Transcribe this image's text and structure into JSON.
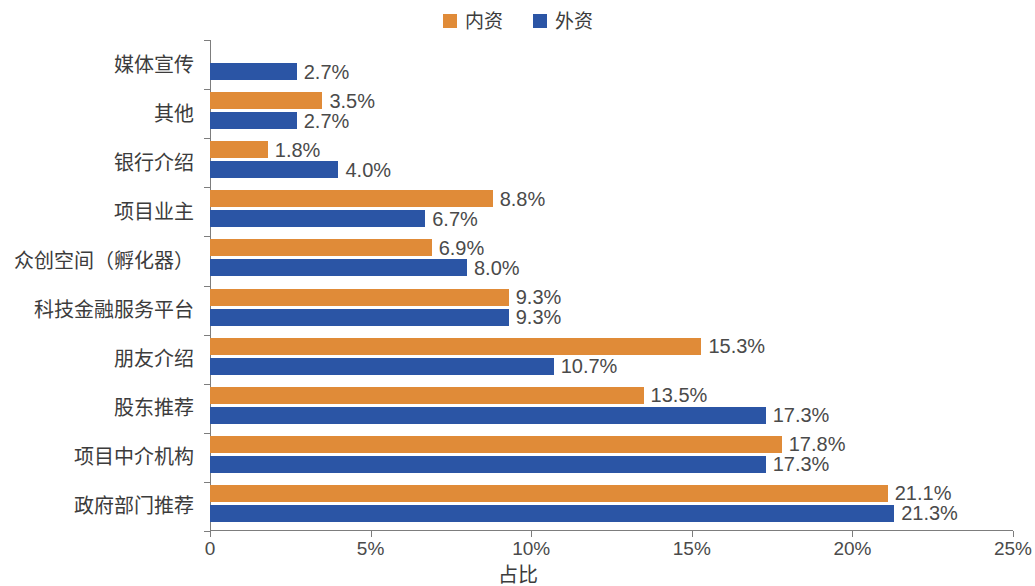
{
  "legend": {
    "entries": [
      {
        "label": "内资",
        "color": "#E08B38"
      },
      {
        "label": "外资",
        "color": "#2B55A5"
      }
    ]
  },
  "axis": {
    "x_title": "占比",
    "ticks": [
      "0",
      "5%",
      "10%",
      "15%",
      "20%",
      "25%"
    ]
  },
  "chart_data": {
    "type": "bar",
    "orientation": "horizontal",
    "title": "",
    "xlabel": "占比",
    "ylabel": "",
    "xlim": [
      0,
      25
    ],
    "xtick_values": [
      0,
      5,
      10,
      15,
      20,
      25
    ],
    "xtick_labels": [
      "0",
      "5%",
      "10%",
      "15%",
      "20%",
      "25%"
    ],
    "grid": false,
    "legend_position": "top-center",
    "categories": [
      "媒体宣传",
      "其他",
      "银行介绍",
      "项目业主",
      "众创空间（孵化器）",
      "科技金融服务平台",
      "朋友介绍",
      "股东推荐",
      "项目中介机构",
      "政府部门推荐"
    ],
    "series": [
      {
        "name": "内资",
        "color": "#E08B38",
        "values": [
          null,
          3.5,
          1.8,
          8.8,
          6.9,
          9.3,
          15.3,
          13.5,
          17.8,
          21.1
        ],
        "labels": [
          "",
          "3.5%",
          "1.8%",
          "8.8%",
          "6.9%",
          "9.3%",
          "15.3%",
          "13.5%",
          "17.8%",
          "21.1%"
        ]
      },
      {
        "name": "外资",
        "color": "#2B55A5",
        "values": [
          2.7,
          2.7,
          4.0,
          6.7,
          8.0,
          9.3,
          10.7,
          17.3,
          17.3,
          21.3
        ],
        "labels": [
          "2.7%",
          "2.7%",
          "4.0%",
          "6.7%",
          "8.0%",
          "9.3%",
          "10.7%",
          "17.3%",
          "17.3%",
          "21.3%"
        ]
      }
    ]
  }
}
